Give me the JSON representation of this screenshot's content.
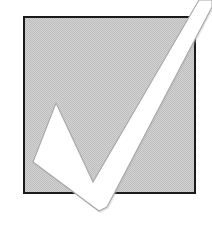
{
  "image": {
    "title": "Checkmark over gray square",
    "alt_text": "A white check mark with a thin gray outline drawn across a light gray dithered square with a black border",
    "width": 212,
    "height": 225,
    "background_color": "#ffffff"
  },
  "colors": {
    "page_background": "#ffffff",
    "square_fill": "#c9c9c9",
    "square_fill_dither_light": "#d7d7d7",
    "square_fill_dither_dark": "#bcbcbc",
    "square_border": "#1a1a1a",
    "check_fill": "#ffffff",
    "check_outline": "#a8a8a8",
    "check_shadow": "#b5b5b5"
  },
  "shapes": {
    "square": {
      "name": "gray-square",
      "x": 23,
      "y": 16,
      "width": 173,
      "height": 178,
      "border_width": 2,
      "fill": "#c9c9c9",
      "stroke": "#1a1a1a"
    },
    "checkmark": {
      "name": "checkmark",
      "fill": "#ffffff",
      "stroke": "#a8a8a8",
      "stroke_width": 1,
      "points": "56,103 93,182 199,0 212,0 212,7 107,207 99,211 33,162"
    }
  },
  "labels": {
    "square_label": "gray square",
    "check_label": "check mark"
  }
}
